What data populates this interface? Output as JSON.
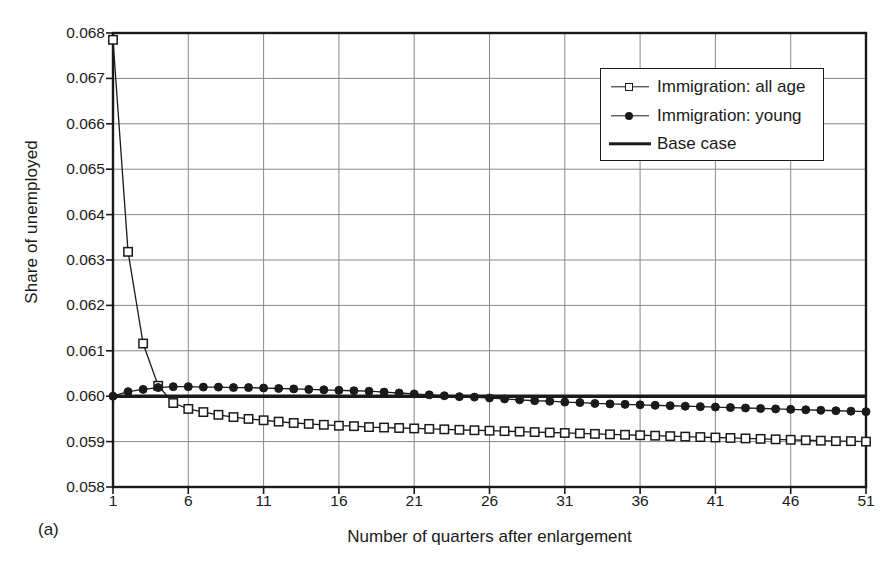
{
  "figure": {
    "panel_caption": "(a)",
    "plot_area": {
      "x": 113,
      "y": 33,
      "width": 753,
      "height": 454
    }
  },
  "legend": {
    "position": "top-right-inside",
    "entries": [
      {
        "label": "Immigration: all age",
        "marker": "open-square",
        "line": "thin"
      },
      {
        "label": "Immigration: young",
        "marker": "filled-circle",
        "line": "thin"
      },
      {
        "label": "Base case",
        "marker": "none",
        "line": "thick"
      }
    ]
  },
  "chart_data": {
    "type": "line",
    "title": "",
    "subtitle": "",
    "xlabel": "Number of quarters after enlargement",
    "ylabel": "Share of unemployed",
    "xlim": [
      1,
      51
    ],
    "ylim": [
      0.058,
      0.068
    ],
    "xticks": [
      1,
      6,
      11,
      16,
      21,
      26,
      31,
      36,
      41,
      46,
      51
    ],
    "xticklabels": [
      "1",
      "6",
      "11",
      "16",
      "21",
      "26",
      "31",
      "36",
      "41",
      "46",
      "51"
    ],
    "yticks": [
      0.058,
      0.059,
      0.06,
      0.061,
      0.062,
      0.063,
      0.064,
      0.065,
      0.066,
      0.067,
      0.068
    ],
    "yticklabels": [
      "0.058",
      "0.059",
      "0.060",
      "0.061",
      "0.062",
      "0.063",
      "0.064",
      "0.065",
      "0.066",
      "0.067",
      "0.068"
    ],
    "grid": true,
    "grid_axis": "both",
    "x": [
      1,
      2,
      3,
      4,
      5,
      6,
      7,
      8,
      9,
      10,
      11,
      12,
      13,
      14,
      15,
      16,
      17,
      18,
      19,
      20,
      21,
      22,
      23,
      24,
      25,
      26,
      27,
      28,
      29,
      30,
      31,
      32,
      33,
      34,
      35,
      36,
      37,
      38,
      39,
      40,
      41,
      42,
      43,
      44,
      45,
      46,
      47,
      48,
      49,
      50,
      51
    ],
    "series": [
      {
        "name": "Immigration: all age",
        "marker": "open-square",
        "color": "#1a1a1a",
        "values": [
          0.06785,
          0.06318,
          0.06116,
          0.06023,
          0.05985,
          0.05972,
          0.05965,
          0.05959,
          0.05954,
          0.0595,
          0.05947,
          0.05944,
          0.05941,
          0.05939,
          0.05937,
          0.05935,
          0.05934,
          0.05932,
          0.05931,
          0.0593,
          0.05929,
          0.05928,
          0.05927,
          0.05926,
          0.05925,
          0.05924,
          0.05923,
          0.05922,
          0.05921,
          0.0592,
          0.05919,
          0.05918,
          0.05917,
          0.05916,
          0.05915,
          0.05914,
          0.05913,
          0.05912,
          0.05911,
          0.0591,
          0.05909,
          0.05908,
          0.05907,
          0.05906,
          0.05905,
          0.05904,
          0.05903,
          0.05902,
          0.05901,
          0.05901,
          0.059
        ]
      },
      {
        "name": "Immigration: young",
        "marker": "filled-circle",
        "color": "#1a1a1a",
        "values": [
          0.06,
          0.0601,
          0.06015,
          0.06019,
          0.06021,
          0.06021,
          0.0602,
          0.0602,
          0.06019,
          0.06019,
          0.06018,
          0.06017,
          0.06016,
          0.06015,
          0.06014,
          0.06013,
          0.06012,
          0.06011,
          0.06009,
          0.06007,
          0.06005,
          0.06003,
          0.06001,
          0.05999,
          0.05998,
          0.05996,
          0.05994,
          0.05992,
          0.0599,
          0.05989,
          0.05987,
          0.05986,
          0.05984,
          0.05983,
          0.05982,
          0.05981,
          0.0598,
          0.05979,
          0.05978,
          0.05977,
          0.05976,
          0.05975,
          0.05974,
          0.05973,
          0.05972,
          0.05971,
          0.0597,
          0.05969,
          0.05968,
          0.05967,
          0.05966
        ]
      },
      {
        "name": "Base case",
        "marker": "none",
        "color": "#1a1a1a",
        "values": [
          0.06,
          0.06,
          0.06,
          0.06,
          0.06,
          0.06,
          0.06,
          0.06,
          0.06,
          0.06,
          0.06,
          0.06,
          0.06,
          0.06,
          0.06,
          0.06,
          0.06,
          0.06,
          0.06,
          0.06,
          0.06,
          0.06,
          0.06,
          0.06,
          0.06,
          0.06,
          0.06,
          0.06,
          0.06,
          0.06,
          0.06,
          0.06,
          0.06,
          0.06,
          0.06,
          0.06,
          0.06,
          0.06,
          0.06,
          0.06,
          0.06,
          0.06,
          0.06,
          0.06,
          0.06,
          0.06,
          0.06,
          0.06,
          0.06,
          0.06,
          0.06
        ]
      }
    ]
  }
}
